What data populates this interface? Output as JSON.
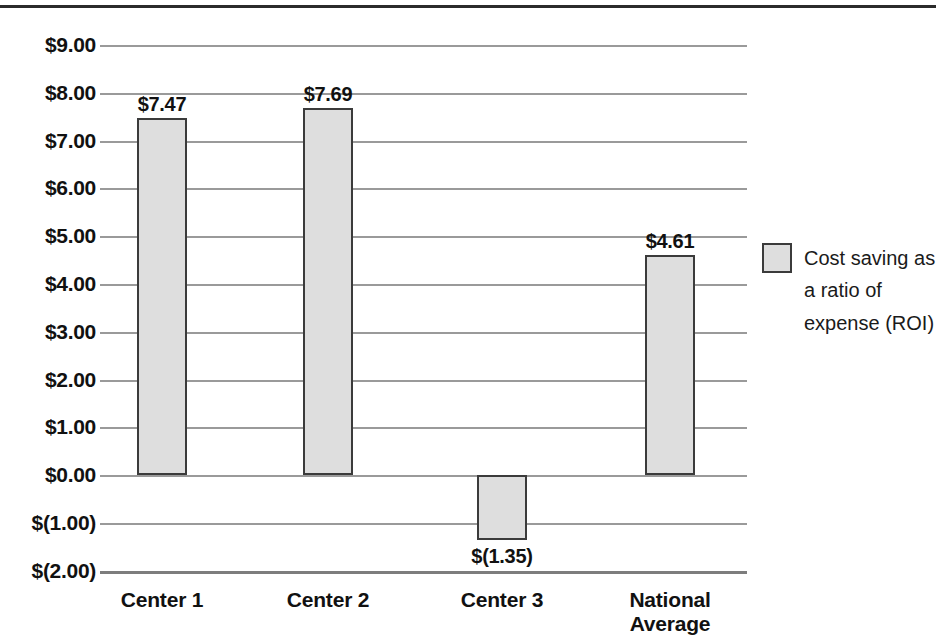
{
  "chart_data": {
    "type": "bar",
    "title": "",
    "xlabel": "",
    "ylabel": "",
    "categories": [
      "Center 1",
      "Center 2",
      "Center 3",
      "National\nAverage"
    ],
    "values": [
      7.47,
      7.69,
      -1.35,
      4.61
    ],
    "data_labels": [
      "$7.47",
      "$7.69",
      "$(1.35)",
      "$4.61"
    ],
    "series": [
      {
        "name": "Cost saving as a ratio of expense (ROI)",
        "values": [
          7.47,
          7.69,
          -1.35,
          4.61
        ]
      }
    ],
    "ylim": [
      -2,
      9
    ],
    "ytick_values": [
      9,
      8,
      7,
      6,
      5,
      4,
      3,
      2,
      1,
      0,
      -1,
      -2
    ],
    "ytick_labels": [
      "$9.00",
      "$8.00",
      "$7.00",
      "$6.00",
      "$5.00",
      "$4.00",
      "$3.00",
      "$2.00",
      "$1.00",
      "$0.00",
      "$(1.00)",
      "$(2.00)"
    ],
    "grid": true,
    "legend_position": "right",
    "legend_entries": [
      "Cost saving as a ratio of expense (ROI)"
    ],
    "colors": {
      "bar_fill": "#dedede",
      "bar_stroke": "#3b3b3b",
      "gridline": "#9a9a9a",
      "text": "#111111"
    }
  },
  "legend": {
    "swatch_name": "bar-series-swatch",
    "label": "Cost saving as a ratio of expense (ROI)"
  }
}
